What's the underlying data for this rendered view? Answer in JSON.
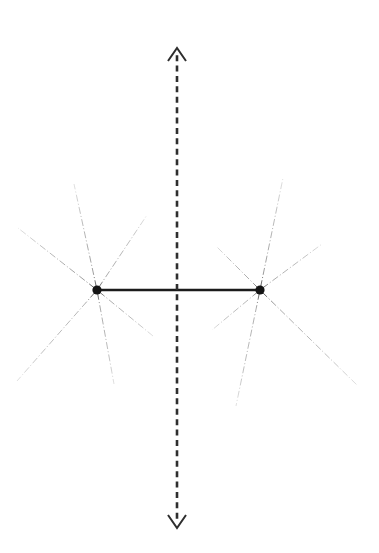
{
  "figure": {
    "title": "",
    "width": 379,
    "height": 553,
    "background_color": "#ffffff"
  },
  "chart_data": {
    "type": "scatter",
    "title": "",
    "subtitle": "",
    "xlabel": "",
    "ylabel": "",
    "grid": false,
    "legend": null,
    "annotations": [],
    "xlim": [
      0,
      379
    ],
    "ylim": [
      0,
      553
    ],
    "nodes": [
      {
        "id": "node-left",
        "label": "",
        "x": 97,
        "y": 290,
        "radius": 4.6,
        "color": "#141414"
      },
      {
        "id": "node-right",
        "label": "",
        "x": 260,
        "y": 290,
        "radius": 4.6,
        "color": "#141414"
      }
    ],
    "bonds": [
      {
        "id": "bond-center",
        "from": "node-left",
        "to": "node-right",
        "x1": 97,
        "y1": 290,
        "x2": 260,
        "y2": 290,
        "width": 2.4,
        "color": "#1b1b1b",
        "style": "solid"
      }
    ],
    "symmetry_axis": {
      "id": "axis-vertical",
      "orientation": "vertical",
      "x": 177,
      "y_top": 48,
      "y_bottom": 528,
      "style": "dashed",
      "dash_length": 6,
      "gap_length": 4.4,
      "width": 2.6,
      "color": "#2e2e2e",
      "arrow_top": true,
      "arrow_bottom": true,
      "arrow_half_width": 9,
      "arrow_length": 13
    },
    "spokes": [
      {
        "id": "spoke-l1",
        "node": "node-left",
        "x1": 97,
        "y1": 290,
        "x2": 18,
        "y2": 228,
        "angle_deg": 141.8,
        "color": "#8c8c8c",
        "width": 0.85,
        "style": "dashdot"
      },
      {
        "id": "spoke-l2",
        "node": "node-left",
        "x1": 97,
        "y1": 290,
        "x2": 74,
        "y2": 184,
        "angle_deg": 102.2,
        "color": "#8c8c8c",
        "width": 0.85,
        "style": "dashdot"
      },
      {
        "id": "spoke-l3",
        "node": "node-left",
        "x1": 97,
        "y1": 290,
        "x2": 147,
        "y2": 215,
        "angle_deg": 56.3,
        "color": "#9a9a9a",
        "width": 0.85,
        "style": "dashdot"
      },
      {
        "id": "spoke-l4",
        "node": "node-left",
        "x1": 97,
        "y1": 290,
        "x2": 153,
        "y2": 336,
        "angle_deg": -39.4,
        "color": "#9a9a9a",
        "width": 0.85,
        "style": "dashdot"
      },
      {
        "id": "spoke-l5",
        "node": "node-left",
        "x1": 97,
        "y1": 290,
        "x2": 114,
        "y2": 384,
        "angle_deg": -79.7,
        "color": "#9a9a9a",
        "width": 0.85,
        "style": "dashdot"
      },
      {
        "id": "spoke-l6",
        "node": "node-left",
        "x1": 97,
        "y1": 290,
        "x2": 17,
        "y2": 381,
        "angle_deg": -131.3,
        "color": "#a8a8a8",
        "width": 0.85,
        "style": "dashdot"
      },
      {
        "id": "spoke-r1",
        "node": "node-right",
        "x1": 260,
        "y1": 290,
        "x2": 216,
        "y2": 246,
        "angle_deg": 135.0,
        "color": "#9a9a9a",
        "width": 0.85,
        "style": "dashdot"
      },
      {
        "id": "spoke-r2",
        "node": "node-right",
        "x1": 260,
        "y1": 290,
        "x2": 283,
        "y2": 178,
        "angle_deg": 101.6,
        "color": "#8c8c8c",
        "width": 0.85,
        "style": "dashdot"
      },
      {
        "id": "spoke-r3",
        "node": "node-right",
        "x1": 260,
        "y1": 290,
        "x2": 322,
        "y2": 244,
        "angle_deg": 36.6,
        "color": "#9a9a9a",
        "width": 0.85,
        "style": "dashdot"
      },
      {
        "id": "spoke-r4",
        "node": "node-right",
        "x1": 260,
        "y1": 290,
        "x2": 358,
        "y2": 386,
        "angle_deg": -44.4,
        "color": "#9a9a9a",
        "width": 0.85,
        "style": "dashdot"
      },
      {
        "id": "spoke-r5",
        "node": "node-right",
        "x1": 260,
        "y1": 290,
        "x2": 236,
        "y2": 406,
        "angle_deg": -101.7,
        "color": "#a0a0a0",
        "width": 0.85,
        "style": "dashdot"
      },
      {
        "id": "spoke-r6",
        "node": "node-right",
        "x1": 260,
        "y1": 290,
        "x2": 212,
        "y2": 330,
        "angle_deg": -140.2,
        "color": "#a8a8a8",
        "width": 0.85,
        "style": "dashdot"
      }
    ]
  }
}
